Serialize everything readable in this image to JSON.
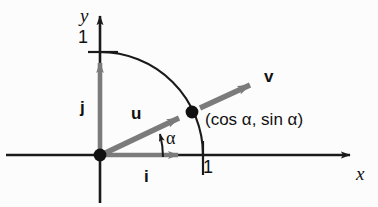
{
  "figure": {
    "background_color": "#fcfcfc",
    "axis_color": "#1a1a1a",
    "vector_color": "#7b7b7b",
    "arc_color": "#1a1a1a",
    "point_color": "#111111"
  },
  "axes": {
    "x_label": "x",
    "y_label": "y",
    "origin": {
      "x": 100,
      "y": 155
    },
    "x_tick_value": "1",
    "y_tick_value": "1",
    "unit_length_px": 103
  },
  "vectors": [
    {
      "name": "i",
      "label": "i",
      "description": "unit vector along x axis",
      "from": [
        0,
        0
      ],
      "to": [
        1,
        0
      ],
      "color": "#7b7b7b"
    },
    {
      "name": "j",
      "label": "j",
      "description": "unit vector along y axis",
      "from": [
        0,
        0
      ],
      "to": [
        0,
        1
      ],
      "color": "#7b7b7b"
    },
    {
      "name": "u",
      "label": "u",
      "description": "unit position vector from origin to point on circle",
      "from": [
        0,
        0
      ],
      "to": [
        0.903,
        0.429
      ],
      "color": "#7b7b7b"
    },
    {
      "name": "v",
      "label": "v",
      "description": "vector parallel to u continuing beyond the circle",
      "from": [
        0.903,
        0.429
      ],
      "to": [
        1.55,
        0.74
      ],
      "color": "#7b7b7b"
    }
  ],
  "angle": {
    "label": "α",
    "description": "angle alpha between positive x axis and vector u",
    "degrees": 26
  },
  "point": {
    "label": "(cos α, sin α)",
    "coords": [
      0.903,
      0.429
    ],
    "marker": "filled-dot"
  },
  "arc": {
    "description": "quarter unit circle arc from (0,1) to (1,0)",
    "radius": 1,
    "start_angle_deg": 90,
    "end_angle_deg": 0
  }
}
